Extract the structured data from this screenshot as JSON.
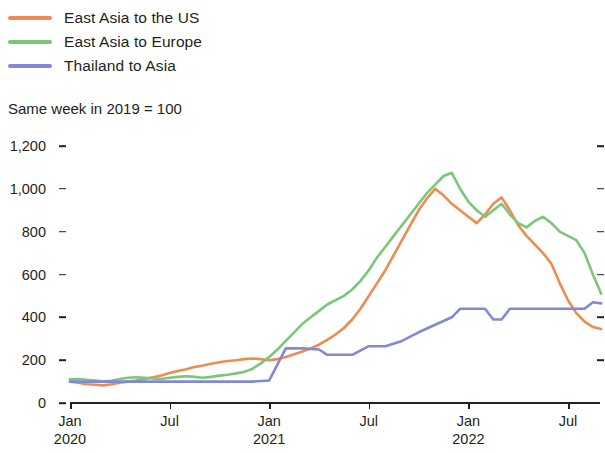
{
  "legend": {
    "items": [
      {
        "label": "East Asia to the US",
        "color": "#ef8b4f",
        "key": "east_asia_us"
      },
      {
        "label": "East Asia to Europe",
        "color": "#79c878",
        "key": "east_asia_europe"
      },
      {
        "label": "Thailand to Asia",
        "color": "#8189d6",
        "key": "thailand_asia"
      }
    ]
  },
  "subtitle": "Same week in 2019 = 100",
  "axis": {
    "y_ticks": [
      "0",
      "200",
      "400",
      "600",
      "800",
      "1,000",
      "1,200"
    ],
    "x_ticks": [
      {
        "month": "Jan",
        "year": "2020"
      },
      {
        "month": "Jul",
        "year": ""
      },
      {
        "month": "Jan",
        "year": "2021"
      },
      {
        "month": "Jul",
        "year": ""
      },
      {
        "month": "Jan",
        "year": "2022"
      },
      {
        "month": "Jul",
        "year": ""
      }
    ]
  },
  "chart_data": {
    "type": "line",
    "title": "",
    "subtitle": "Same week in 2019 = 100",
    "xlabel": "",
    "ylabel": "",
    "ylim": [
      0,
      1200
    ],
    "y_ticks": [
      0,
      200,
      400,
      600,
      800,
      1000,
      1200
    ],
    "grid": false,
    "legend_position": "top-left",
    "x_unit": "week",
    "x_start": "2020-01",
    "x_end": "2022-09",
    "x_tick_labels": [
      "Jan 2020",
      "Jul",
      "Jan 2021",
      "Jul",
      "Jan 2022",
      "Jul"
    ],
    "x_tick_positions_months": [
      0,
      6,
      12,
      18,
      24,
      30
    ],
    "series": [
      {
        "name": "East Asia to the US",
        "color": "#ef8b4f",
        "x_months": [
          0,
          0.5,
          1,
          1.5,
          2,
          2.5,
          3,
          3.5,
          4,
          4.5,
          5,
          5.5,
          6,
          6.5,
          7,
          7.5,
          8,
          8.5,
          9,
          9.5,
          10,
          10.5,
          11,
          11.5,
          12,
          12.5,
          13,
          13.5,
          14,
          14.5,
          15,
          15.5,
          16,
          16.5,
          17,
          17.5,
          18,
          18.5,
          19,
          19.5,
          20,
          20.5,
          21,
          21.5,
          22,
          22.5,
          23,
          23.5,
          24,
          24.5,
          25,
          25.5,
          26,
          26.5,
          27,
          27.5,
          28,
          28.5,
          29,
          29.5,
          30,
          30.5,
          31,
          31.5,
          32
        ],
        "values": [
          100,
          95,
          88,
          85,
          82,
          88,
          95,
          100,
          105,
          112,
          120,
          128,
          140,
          150,
          158,
          168,
          175,
          183,
          190,
          196,
          200,
          205,
          208,
          205,
          200,
          205,
          215,
          228,
          240,
          255,
          272,
          295,
          320,
          350,
          390,
          440,
          500,
          560,
          620,
          690,
          760,
          830,
          900,
          955,
          1000,
          970,
          930,
          900,
          870,
          840,
          880,
          930,
          960,
          900,
          830,
          780,
          740,
          700,
          650,
          560,
          480,
          420,
          380,
          355,
          345
        ]
      },
      {
        "name": "East Asia to Europe",
        "color": "#79c878",
        "x_months": [
          0,
          0.5,
          1,
          1.5,
          2,
          2.5,
          3,
          3.5,
          4,
          4.5,
          5,
          5.5,
          6,
          6.5,
          7,
          7.5,
          8,
          8.5,
          9,
          9.5,
          10,
          10.5,
          11,
          11.5,
          12,
          12.5,
          13,
          13.5,
          14,
          14.5,
          15,
          15.5,
          16,
          16.5,
          17,
          17.5,
          18,
          18.5,
          19,
          19.5,
          20,
          20.5,
          21,
          21.5,
          22,
          22.5,
          23,
          23.5,
          24,
          24.5,
          25,
          25.5,
          26,
          26.5,
          27,
          27.5,
          28,
          28.5,
          29,
          29.5,
          30,
          30.5,
          31,
          31.5,
          32
        ],
        "values": [
          110,
          112,
          108,
          105,
          102,
          104,
          112,
          118,
          120,
          118,
          115,
          112,
          118,
          122,
          125,
          122,
          118,
          122,
          128,
          132,
          138,
          145,
          160,
          185,
          215,
          250,
          290,
          330,
          370,
          400,
          430,
          460,
          480,
          500,
          530,
          570,
          620,
          680,
          730,
          780,
          830,
          880,
          930,
          980,
          1020,
          1060,
          1075,
          1000,
          940,
          900,
          870,
          900,
          930,
          880,
          840,
          820,
          850,
          870,
          840,
          800,
          780,
          760,
          700,
          600,
          510
        ]
      },
      {
        "name": "Thailand to Asia",
        "color": "#8189d6",
        "x_months": [
          0,
          1,
          2,
          3,
          4,
          5,
          6,
          7,
          8,
          9,
          10,
          11,
          12,
          12.5,
          13,
          14,
          15,
          15.5,
          16,
          17,
          18,
          18.5,
          19,
          20,
          21,
          22,
          23,
          23.5,
          24,
          25,
          25.5,
          26,
          26.5,
          27,
          28,
          28.5,
          29,
          30,
          31,
          31.5,
          32
        ],
        "values": [
          100,
          100,
          100,
          100,
          100,
          100,
          100,
          100,
          100,
          100,
          100,
          100,
          105,
          180,
          255,
          255,
          250,
          225,
          225,
          225,
          265,
          265,
          265,
          290,
          330,
          365,
          400,
          440,
          440,
          440,
          390,
          390,
          440,
          440,
          440,
          440,
          440,
          440,
          440,
          470,
          465
        ]
      }
    ]
  }
}
